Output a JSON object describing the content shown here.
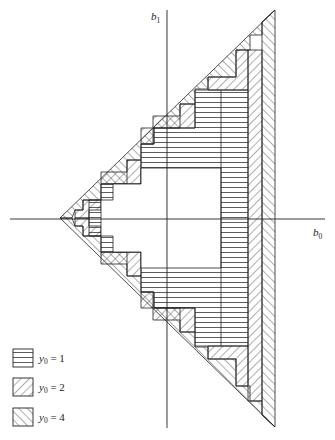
{
  "axes": {
    "x_label": "b",
    "x_sub": "0",
    "y_label": "b",
    "y_sub": "1"
  },
  "legend": [
    {
      "var": "y",
      "sub": "0",
      "rel": " = 1",
      "pattern": "horizontal"
    },
    {
      "var": "y",
      "sub": "0",
      "rel": " = 2",
      "pattern": "forward-diagonal"
    },
    {
      "var": "y",
      "sub": "0",
      "rel": " = 4",
      "pattern": "backward-diagonal"
    }
  ],
  "colors": {
    "stroke": "#222222",
    "background": "#ffffff"
  }
}
